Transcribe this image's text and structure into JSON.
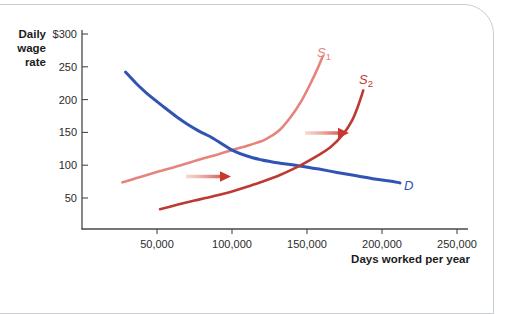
{
  "frame": {
    "border_color": "#c9ccd0",
    "background": "#ffffff"
  },
  "chart_data": {
    "type": "line",
    "title": "",
    "ylabel_lines": [
      "Daily",
      "wage",
      "rate"
    ],
    "xlabel": "Days worked per year",
    "xlim": [
      0,
      250000
    ],
    "ylim": [
      0,
      300
    ],
    "grid": false,
    "axis_color": "#48494b",
    "text_color": "#2b2b2b",
    "y_ticks": {
      "values": [
        300,
        250,
        200,
        150,
        100,
        50
      ],
      "labels": [
        "$300",
        "250",
        "200",
        "150",
        "100",
        "50"
      ]
    },
    "x_ticks": {
      "values": [
        50000,
        100000,
        150000,
        200000,
        250000
      ],
      "labels": [
        "50,000",
        "100,000",
        "150,000",
        "200,000",
        "250,000"
      ]
    },
    "series": [
      {
        "name": "S1",
        "role": "supply-initial",
        "color": "#e5847c",
        "stroke_width": 2.6,
        "label": {
          "text": "S",
          "sub": "1",
          "x_px": 317,
          "y_px": 57
        },
        "points": [
          [
            27000,
            74
          ],
          [
            40000,
            83
          ],
          [
            52000,
            91
          ],
          [
            66000,
            100
          ],
          [
            79000,
            109
          ],
          [
            90000,
            116
          ],
          [
            100000,
            123
          ],
          [
            112000,
            131
          ],
          [
            122000,
            139
          ],
          [
            131000,
            152
          ],
          [
            139000,
            173
          ],
          [
            146000,
            197
          ],
          [
            152000,
            223
          ],
          [
            157000,
            247
          ],
          [
            160500,
            266
          ]
        ]
      },
      {
        "name": "D",
        "role": "demand",
        "color": "#3154b4",
        "stroke_width": 3,
        "label": {
          "text": "D",
          "sub": "",
          "x_px": 404,
          "y_px": 190
        },
        "points": [
          [
            29000,
            242
          ],
          [
            36000,
            225
          ],
          [
            44000,
            208
          ],
          [
            55000,
            188
          ],
          [
            63000,
            174
          ],
          [
            70000,
            163
          ],
          [
            78000,
            152
          ],
          [
            85000,
            144
          ],
          [
            93000,
            133
          ],
          [
            100000,
            123
          ],
          [
            110000,
            114
          ],
          [
            120000,
            108
          ],
          [
            132000,
            103
          ],
          [
            145000,
            99
          ],
          [
            158000,
            94
          ],
          [
            170000,
            89
          ],
          [
            183000,
            84
          ],
          [
            195000,
            79
          ],
          [
            205000,
            76
          ],
          [
            212000,
            73
          ]
        ]
      },
      {
        "name": "S2",
        "role": "supply-shifted",
        "color": "#bd3a32",
        "stroke_width": 2.6,
        "label": {
          "text": "S",
          "sub": "2",
          "x_px": 359,
          "y_px": 84
        },
        "points": [
          [
            52000,
            33
          ],
          [
            64000,
            40
          ],
          [
            75000,
            46
          ],
          [
            88000,
            53
          ],
          [
            100000,
            60
          ],
          [
            110000,
            67
          ],
          [
            119000,
            74
          ],
          [
            132000,
            85
          ],
          [
            145000,
            99
          ],
          [
            156000,
            113
          ],
          [
            166000,
            128
          ],
          [
            174000,
            147
          ],
          [
            180000,
            168
          ],
          [
            184000,
            190
          ],
          [
            186500,
            207
          ],
          [
            187500,
            214
          ]
        ]
      }
    ],
    "arrows": [
      {
        "name": "shift-arrow-lower",
        "x1_px": 186,
        "x2_px": 231,
        "y_px": 176.5,
        "tail_color": "#f0b9b0",
        "head_color": "#c9372e"
      },
      {
        "name": "shift-arrow-upper",
        "x1_px": 305,
        "x2_px": 349,
        "y_px": 133,
        "tail_color": "#f0b9b0",
        "head_color": "#c9372e"
      }
    ],
    "equilibria": [
      {
        "label": "initial (D x S1)",
        "x": 100000,
        "y": 123
      },
      {
        "label": "after shift (D x S2)",
        "x": 145000,
        "y": 99
      }
    ]
  }
}
